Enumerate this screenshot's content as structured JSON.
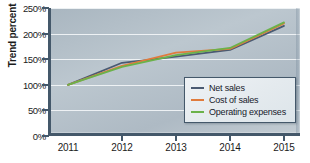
{
  "chart_data": {
    "type": "line",
    "title": "",
    "xlabel": "",
    "ylabel": "Trend percent",
    "categories": [
      "2011",
      "2012",
      "2013",
      "2014",
      "2015"
    ],
    "x": [
      2011,
      2012,
      2013,
      2014,
      2015
    ],
    "ylim": [
      0,
      250
    ],
    "ytick_values": [
      0,
      50,
      100,
      150,
      200,
      250
    ],
    "ytick_labels": [
      "0%",
      "50%",
      "100%",
      "150%",
      "200%",
      "250%"
    ],
    "grid": true,
    "legend_position": "lower-right-inside",
    "series": [
      {
        "name": "Net sales",
        "color": "#4a5a72",
        "values": [
          100,
          143,
          155,
          168,
          215
        ]
      },
      {
        "name": "Cost of sales",
        "color": "#e07b3c",
        "values": [
          100,
          137,
          163,
          170,
          220
        ]
      },
      {
        "name": "Operating expenses",
        "color": "#6bb24a",
        "values": [
          100,
          135,
          158,
          172,
          222
        ]
      }
    ]
  },
  "axis": {
    "y_title": "Trend percent"
  },
  "legend": {
    "items": [
      {
        "label": "Net sales"
      },
      {
        "label": "Cost of sales"
      },
      {
        "label": "Operating expenses"
      }
    ]
  },
  "colors": {
    "axis_line": "#44586a",
    "gridline": "#f2f5f7",
    "plot_background_top": "#a9b6c0",
    "plot_background_bottom": "#c3ccd3",
    "legend_border": "#44586a",
    "text": "#1b1b1b"
  }
}
